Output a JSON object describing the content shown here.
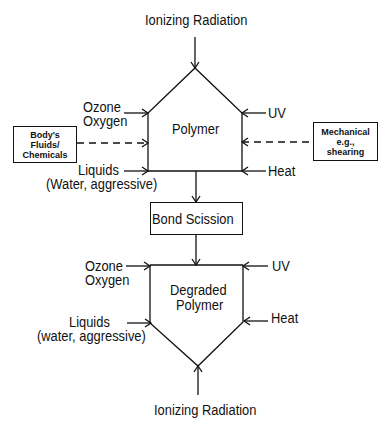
{
  "diagram": {
    "title_top": "Ionizing Radiation",
    "title_bottom": "Ionizing Radiation",
    "upper_node": {
      "label": "Polymer",
      "inputs_left": [
        {
          "line1": "Ozone",
          "line2": "Oxygen"
        },
        {
          "line1": "Liquids",
          "line2": "(Water, aggressive)"
        }
      ],
      "inputs_right": [
        "UV",
        "Heat"
      ]
    },
    "side_boxes": {
      "left": {
        "line1": "Body's",
        "line2": "Fluids/",
        "line3": "Chemicals"
      },
      "right": {
        "line1": "Mechanical",
        "line2": "e.g.,",
        "line3": "shearing"
      }
    },
    "middle_node": {
      "label": "Bond Scission"
    },
    "lower_node": {
      "line1": "Degraded",
      "line2": "Polymer",
      "inputs_left": [
        {
          "line1": "Ozone",
          "line2": "Oxygen"
        },
        {
          "line1": "Liquids",
          "line2": "(water, aggressive)"
        }
      ],
      "inputs_right": [
        "UV",
        "Heat"
      ]
    },
    "colors": {
      "stroke": "#111111",
      "background": "#ffffff"
    }
  }
}
